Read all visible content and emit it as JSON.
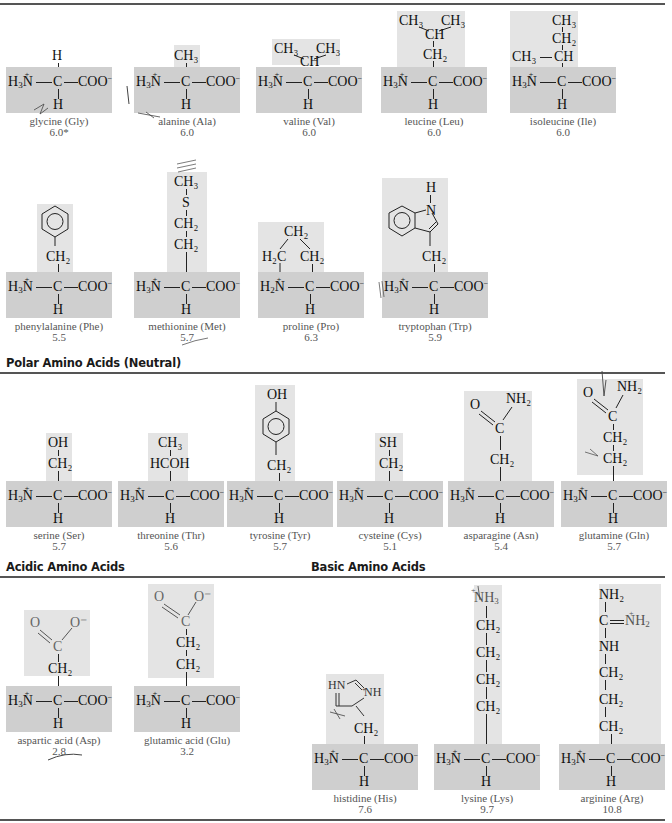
{
  "sections": {
    "nonpolar": {
      "title": ""
    },
    "polar": {
      "title": "Polar Amino Acids (Neutral)"
    },
    "acidic": {
      "title": "Acidic Amino Acids"
    },
    "basic": {
      "title": "Basic Amino Acids"
    }
  },
  "core": {
    "amine": "H₃N",
    "amine_pro": "H₂N",
    "alpha_c": "C",
    "carboxylate": "COO",
    "charge_minus": "−",
    "charge_plus": "+",
    "alpha_h": "H"
  },
  "amino_acids": {
    "gly": {
      "name": "glycine (Gly)",
      "pi": "6.0*",
      "side": [
        "H"
      ]
    },
    "ala": {
      "name": "alanine (Ala)",
      "pi": "6.0",
      "side": [
        "CH₃"
      ]
    },
    "val": {
      "name": "valine (Val)",
      "pi": "6.0",
      "side": [
        "CH₃",
        "CH₃",
        "CH"
      ]
    },
    "leu": {
      "name": "leucine (Leu)",
      "pi": "6.0",
      "side": [
        "CH₃",
        "CH₃",
        "CH",
        "CH₂"
      ]
    },
    "ile": {
      "name": "isoleucine (Ile)",
      "pi": "6.0",
      "side": [
        "CH₃",
        "CH₂",
        "CH₃",
        "CH"
      ]
    },
    "phe": {
      "name": "phenylalanine (Phe)",
      "pi": "5.5",
      "side": [
        "benzene-ring",
        "CH₂"
      ]
    },
    "met": {
      "name": "methionine (Met)",
      "pi": "5.7",
      "side": [
        "CH₃",
        "S",
        "CH₂",
        "CH₂"
      ]
    },
    "pro": {
      "name": "proline (Pro)",
      "pi": "6.3",
      "side": [
        "CH₂",
        "H₂C",
        "CH₂"
      ]
    },
    "trp": {
      "name": "tryptophan (Trp)",
      "pi": "5.9",
      "side": [
        "H",
        "N",
        "indole-ring",
        "CH₂"
      ]
    },
    "ser": {
      "name": "serine (Ser)",
      "pi": "5.7",
      "side": [
        "OH",
        "CH₂"
      ]
    },
    "thr": {
      "name": "threonine (Thr)",
      "pi": "5.6",
      "side": [
        "CH₃",
        "HCOH"
      ]
    },
    "tyr": {
      "name": "tyrosine (Tyr)",
      "pi": "5.7",
      "side": [
        "OH",
        "benzene-ring",
        "CH₂"
      ]
    },
    "cys": {
      "name": "cysteine (Cys)",
      "pi": "5.1",
      "side": [
        "SH",
        "CH₂"
      ]
    },
    "asn": {
      "name": "asparagine (Asn)",
      "pi": "5.4",
      "side": [
        "O",
        "NH₂",
        "C",
        "CH₂"
      ]
    },
    "gln": {
      "name": "glutamine (Gln)",
      "pi": "5.7",
      "side": [
        "O",
        "NH₂",
        "C",
        "CH₂",
        "CH₂"
      ]
    },
    "asp": {
      "name": "aspartic acid (Asp)",
      "pi": "2.8",
      "side": [
        "O",
        "O⁻",
        "C",
        "CH₂"
      ]
    },
    "glu": {
      "name": "glutamic acid (Glu)",
      "pi": "3.2",
      "side": [
        "O",
        "O⁻",
        "C",
        "CH₂",
        "CH₂"
      ]
    },
    "his": {
      "name": "histidine (His)",
      "pi": "7.6",
      "side": [
        "HN",
        "NH",
        "imidazole-ring",
        "CH₂"
      ]
    },
    "lys": {
      "name": "lysine (Lys)",
      "pi": "9.7",
      "side": [
        "NH₃",
        "CH₂",
        "CH₂",
        "CH₂",
        "CH₂"
      ]
    },
    "arg": {
      "name": "arginine (Arg)",
      "pi": "10.8",
      "side": [
        "NH₂",
        "C",
        "NH₂",
        "NH",
        "CH₂",
        "CH₂",
        "CH₂"
      ]
    }
  }
}
